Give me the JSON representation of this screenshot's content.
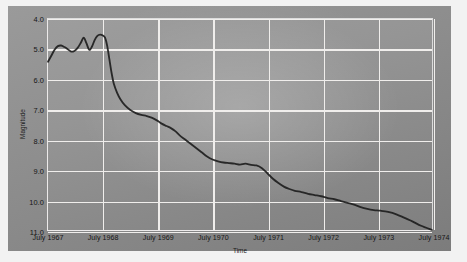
{
  "chart_data": {
    "type": "line",
    "title": "",
    "xlabel": "Time",
    "ylabel": "Magnitude",
    "ylim": [
      4.0,
      11.0
    ],
    "y_inverted": true,
    "grid": true,
    "legend": false,
    "yticks": [
      "4.0",
      "5.0",
      "6.0",
      "7.0",
      "8.0",
      "9.0",
      "10.0",
      "11.0"
    ],
    "ytick_values": [
      4.0,
      5.0,
      6.0,
      7.0,
      8.0,
      9.0,
      10.0,
      11.0
    ],
    "xticks": [
      "July 1967",
      "July 1968",
      "July 1969",
      "July 1970",
      "July 1971",
      "July 1972",
      "July 1973",
      "July 1974"
    ],
    "xtick_values": [
      1967.5,
      1968.5,
      1969.5,
      1970.5,
      1971.5,
      1972.5,
      1973.5,
      1974.5
    ],
    "xlim": [
      1967.5,
      1974.5
    ],
    "series": [
      {
        "name": "Magnitude",
        "color": "#1c1c1c",
        "x": [
          1967.5,
          1967.56,
          1967.62,
          1967.68,
          1967.74,
          1967.8,
          1967.86,
          1967.92,
          1967.98,
          1968.04,
          1968.1,
          1968.15,
          1968.2,
          1968.25,
          1968.3,
          1968.35,
          1968.4,
          1968.45,
          1968.5,
          1968.54,
          1968.58,
          1968.62,
          1968.66,
          1968.7,
          1968.76,
          1968.82,
          1968.9,
          1969.0,
          1969.1,
          1969.2,
          1969.3,
          1969.4,
          1969.5,
          1969.58,
          1969.66,
          1969.74,
          1969.82,
          1969.9,
          1970.0,
          1970.1,
          1970.2,
          1970.3,
          1970.4,
          1970.5,
          1970.6,
          1970.7,
          1970.8,
          1970.9,
          1971.0,
          1971.1,
          1971.2,
          1971.3,
          1971.4,
          1971.5,
          1971.6,
          1971.7,
          1971.8,
          1971.9,
          1972.0,
          1972.12,
          1972.24,
          1972.36,
          1972.48,
          1972.6,
          1972.72,
          1972.84,
          1972.96,
          1973.08,
          1973.2,
          1973.32,
          1973.44,
          1973.56,
          1973.7,
          1973.85,
          1974.0,
          1974.15,
          1974.3,
          1974.5
        ],
        "y": [
          5.42,
          5.22,
          5.02,
          4.9,
          4.88,
          4.93,
          5.0,
          5.08,
          5.06,
          4.96,
          4.78,
          4.62,
          4.8,
          5.02,
          4.92,
          4.7,
          4.56,
          4.52,
          4.55,
          4.62,
          4.9,
          5.35,
          5.8,
          6.15,
          6.45,
          6.66,
          6.86,
          7.02,
          7.12,
          7.18,
          7.22,
          7.28,
          7.38,
          7.48,
          7.55,
          7.62,
          7.72,
          7.86,
          8.0,
          8.14,
          8.28,
          8.42,
          8.56,
          8.66,
          8.72,
          8.76,
          8.78,
          8.8,
          8.83,
          8.8,
          8.84,
          8.86,
          8.95,
          9.12,
          9.3,
          9.44,
          9.56,
          9.64,
          9.7,
          9.74,
          9.8,
          9.84,
          9.88,
          9.94,
          9.98,
          10.04,
          10.1,
          10.16,
          10.24,
          10.3,
          10.34,
          10.36,
          10.4,
          10.48,
          10.6,
          10.72,
          10.86,
          11.0
        ]
      }
    ]
  }
}
